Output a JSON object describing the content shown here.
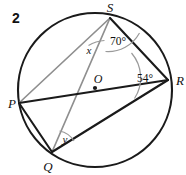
{
  "figure": {
    "problem_number": "2",
    "type": "circle-geometry-diagram",
    "background_color": "#ffffff",
    "stroke_color": "#1a1a1a",
    "light_stroke_color": "#8a8a8a",
    "arc_color": "#9a9a9a",
    "circle": {
      "center_label": "O",
      "center_x": 95,
      "center_y": 90,
      "radius": 77,
      "center_dot_x": 95,
      "center_dot_y": 88,
      "center_label_x": 97,
      "center_label_y": 79
    },
    "points": [
      {
        "label": "S",
        "x": 110,
        "y": 18,
        "label_x": 110,
        "label_y": 9
      },
      {
        "label": "R",
        "x": 168,
        "y": 80,
        "label_x": 177,
        "label_y": 82
      },
      {
        "label": "P",
        "x": 19,
        "y": 103,
        "label_x": 9,
        "label_y": 104
      },
      {
        "label": "Q",
        "x": 52,
        "y": 152,
        "label_x": 47,
        "label_y": 168
      }
    ],
    "segments": [
      {
        "name": "chord-S-P",
        "from": "S",
        "to": "P",
        "shade": "light"
      },
      {
        "name": "chord-S-Q",
        "from": "S",
        "to": "Q",
        "shade": "light"
      },
      {
        "name": "chord-S-R",
        "from": "S",
        "to": "R",
        "shade": "dark"
      },
      {
        "name": "chord-P-R",
        "from": "P",
        "to": "R",
        "shade": "dark"
      },
      {
        "name": "chord-Q-R",
        "from": "Q",
        "to": "R",
        "shade": "dark"
      },
      {
        "name": "chord-P-Q",
        "from": "P",
        "to": "Q",
        "shade": "dark"
      }
    ],
    "angles": [
      {
        "name": "angle-x-at-S",
        "label": "x",
        "vertex": "S",
        "between": [
          "P",
          "Q"
        ],
        "label_x": 89,
        "label_y": 50
      },
      {
        "name": "angle-70-at-S",
        "label": "70°",
        "vertex": "S",
        "between": [
          "Q",
          "R"
        ],
        "label_x": 118,
        "label_y": 41
      },
      {
        "name": "angle-54-at-R",
        "label": "54°",
        "vertex": "R",
        "between": [
          "S",
          "P"
        ],
        "label_x": 143,
        "label_y": 78
      },
      {
        "name": "angle-y-at-Q",
        "label": "y",
        "vertex": "Q",
        "between": [
          "S",
          "R"
        ],
        "label_x": 65,
        "label_y": 139
      }
    ]
  }
}
